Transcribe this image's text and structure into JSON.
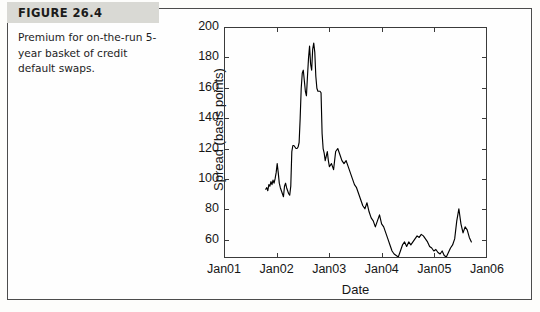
{
  "figure": {
    "label": "FIGURE 26.4",
    "caption": "Premium for on-the-run 5-year basket of credit default swaps.",
    "label_band_color": "#d9d9d4",
    "frame_color": "#4c4c4c"
  },
  "chart_data": {
    "type": "line",
    "title": "",
    "subtitle": "",
    "xlabel": "Date",
    "ylabel": "Spread (basis points)",
    "grid": false,
    "legend": null,
    "line_color": "#000000",
    "xlim": [
      2001.0,
      2006.0
    ],
    "ylim": [
      48,
      200
    ],
    "xticks": [
      2001,
      2002,
      2003,
      2004,
      2005,
      2006
    ],
    "xticklabels": [
      "Jan01",
      "Jan02",
      "Jan03",
      "Jan04",
      "Jan05",
      "Jan06"
    ],
    "yticks": [
      60,
      80,
      100,
      120,
      140,
      160,
      180,
      200
    ],
    "yticklabels": [
      "60",
      "80",
      "100",
      "120",
      "140",
      "160",
      "180",
      "200"
    ],
    "x": [
      2001.78,
      2001.8,
      2001.82,
      2001.84,
      2001.86,
      2001.88,
      2001.9,
      2001.92,
      2001.94,
      2001.96,
      2001.98,
      2002.0,
      2002.02,
      2002.04,
      2002.06,
      2002.08,
      2002.1,
      2002.12,
      2002.14,
      2002.16,
      2002.18,
      2002.2,
      2002.22,
      2002.24,
      2002.26,
      2002.28,
      2002.3,
      2002.32,
      2002.34,
      2002.36,
      2002.38,
      2002.4,
      2002.42,
      2002.44,
      2002.46,
      2002.48,
      2002.5,
      2002.52,
      2002.54,
      2002.56,
      2002.58,
      2002.6,
      2002.62,
      2002.64,
      2002.66,
      2002.68,
      2002.7,
      2002.72,
      2002.74,
      2002.76,
      2002.78,
      2002.8,
      2002.82,
      2002.84,
      2002.86,
      2002.88,
      2002.9,
      2002.92,
      2002.94,
      2002.96,
      2002.98,
      2003.0,
      2003.04,
      2003.08,
      2003.12,
      2003.16,
      2003.2,
      2003.24,
      2003.28,
      2003.32,
      2003.36,
      2003.4,
      2003.44,
      2003.48,
      2003.52,
      2003.56,
      2003.6,
      2003.64,
      2003.68,
      2003.72,
      2003.76,
      2003.8,
      2003.84,
      2003.88,
      2003.92,
      2003.96,
      2004.0,
      2004.04,
      2004.08,
      2004.12,
      2004.16,
      2004.2,
      2004.24,
      2004.28,
      2004.32,
      2004.36,
      2004.4,
      2004.44,
      2004.48,
      2004.52,
      2004.56,
      2004.6,
      2004.64,
      2004.68,
      2004.72,
      2004.76,
      2004.8,
      2004.84,
      2004.88,
      2004.92,
      2004.96,
      2005.0,
      2005.04,
      2005.08,
      2005.12,
      2005.16,
      2005.2,
      2005.24,
      2005.28,
      2005.32,
      2005.36,
      2005.4,
      2005.44,
      2005.48,
      2005.52,
      2005.56,
      2005.6,
      2005.64,
      2005.68,
      2005.72
    ],
    "y": [
      93,
      94,
      92,
      96,
      95,
      98,
      96,
      99,
      97,
      100,
      104,
      110,
      104,
      97,
      94,
      92,
      90,
      88,
      95,
      97,
      94,
      92,
      90,
      89,
      95,
      118,
      122,
      122,
      121,
      120,
      120,
      121,
      124,
      140,
      160,
      170,
      172,
      165,
      158,
      155,
      168,
      180,
      188,
      176,
      172,
      186,
      190,
      184,
      168,
      160,
      158,
      158,
      158,
      157,
      130,
      120,
      117,
      112,
      115,
      118,
      112,
      108,
      110,
      106,
      118,
      120,
      116,
      112,
      110,
      112,
      108,
      104,
      100,
      96,
      94,
      90,
      86,
      82,
      80,
      84,
      78,
      74,
      72,
      68,
      72,
      76,
      70,
      68,
      64,
      60,
      56,
      52,
      50,
      49,
      48,
      52,
      56,
      58,
      55,
      58,
      56,
      58,
      60,
      62,
      61,
      63,
      62,
      60,
      58,
      55,
      54,
      52,
      53,
      51,
      50,
      52,
      49,
      48,
      51,
      54,
      56,
      60,
      72,
      80,
      70,
      64,
      68,
      66,
      61,
      58
    ]
  }
}
